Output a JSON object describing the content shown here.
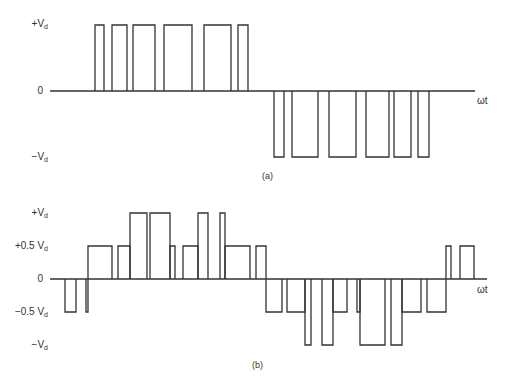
{
  "figure_a": {
    "caption": "(a)",
    "axis_label": "ωt",
    "y_labels": {
      "pos": "+V",
      "zero": "0",
      "neg": "−V",
      "sub": "d"
    },
    "pulses_pos": [
      [
        95,
        104
      ],
      [
        112,
        127
      ],
      [
        133,
        155
      ],
      [
        164,
        192
      ],
      [
        204,
        231
      ],
      [
        238,
        248
      ]
    ],
    "pulses_neg": [
      [
        274,
        284
      ],
      [
        292,
        318
      ],
      [
        329,
        356
      ],
      [
        366,
        389
      ],
      [
        394,
        411
      ],
      [
        418,
        429
      ]
    ]
  },
  "figure_b": {
    "caption": "(b)",
    "axis_label": "ωt",
    "y_labels": {
      "pos": "+V",
      "half_pos": "+0.5 V",
      "zero": "0",
      "half_neg": "−0.5 V",
      "neg": "−V",
      "sub": "d"
    },
    "segments": [
      [
        65,
        76,
        -0.5
      ],
      [
        86,
        88,
        -0.5
      ],
      [
        88,
        112,
        0.5
      ],
      [
        118,
        130,
        0.5
      ],
      [
        130,
        147,
        1
      ],
      [
        150,
        170,
        1
      ],
      [
        170,
        175,
        0.5
      ],
      [
        183,
        198,
        0.5
      ],
      [
        198,
        208,
        1
      ],
      [
        220,
        225,
        1
      ],
      [
        225,
        250,
        0.5
      ],
      [
        256,
        266,
        0.5
      ],
      [
        266,
        282,
        -0.5
      ],
      [
        287,
        305,
        -0.5
      ],
      [
        305,
        311,
        -1
      ],
      [
        322,
        333,
        -1
      ],
      [
        333,
        347,
        -0.5
      ],
      [
        357,
        360,
        -0.5
      ],
      [
        360,
        385,
        -1
      ],
      [
        391,
        402,
        -1
      ],
      [
        402,
        421,
        -0.5
      ],
      [
        427,
        446,
        -0.5
      ],
      [
        446,
        451,
        0.5
      ],
      [
        460,
        474,
        0.5
      ]
    ]
  }
}
